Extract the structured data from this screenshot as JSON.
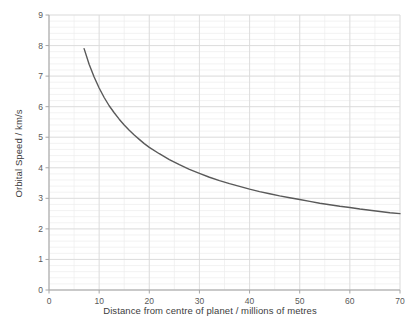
{
  "chart_data": {
    "type": "line",
    "title": "",
    "xlabel": "Distance from centre of planet / millions of metres",
    "ylabel": "Orbital Speed / km/s",
    "xlim": [
      0,
      70
    ],
    "ylim": [
      0,
      9
    ],
    "xticks": [
      0,
      10,
      20,
      30,
      40,
      50,
      60,
      70
    ],
    "yticks": [
      0,
      1,
      2,
      3,
      4,
      5,
      6,
      7,
      8,
      9
    ],
    "xtick_labels": [
      "0",
      "10",
      "20",
      "30",
      "40",
      "50",
      "60",
      "70"
    ],
    "ytick_labels": [
      "0",
      "1",
      "2",
      "3",
      "4",
      "5",
      "6",
      "7",
      "8",
      "9"
    ],
    "grid": true,
    "grid_minor_y_step": 0.2,
    "grid_minor_x_step": 5,
    "legend": false,
    "legend_position": "none",
    "series": [
      {
        "name": "orbital speed",
        "color": "#595959",
        "relation": "v = k / sqrt(r), k = 20.9",
        "x": [
          7,
          8,
          9,
          10,
          11,
          12,
          13,
          14,
          15,
          16,
          17,
          18,
          19,
          20,
          22,
          24,
          26,
          28,
          30,
          32,
          34,
          36,
          38,
          40,
          42,
          44,
          46,
          48,
          50,
          52,
          54,
          56,
          58,
          60,
          62,
          64,
          66,
          68,
          70
        ],
        "y": [
          7.9,
          7.39,
          6.97,
          6.61,
          6.3,
          6.03,
          5.8,
          5.59,
          5.4,
          5.23,
          5.07,
          4.93,
          4.79,
          4.67,
          4.46,
          4.27,
          4.1,
          3.95,
          3.82,
          3.69,
          3.58,
          3.48,
          3.39,
          3.3,
          3.22,
          3.15,
          3.08,
          3.02,
          2.96,
          2.9,
          2.84,
          2.79,
          2.74,
          2.7,
          2.65,
          2.61,
          2.57,
          2.53,
          2.5
        ]
      }
    ]
  },
  "colors": {
    "line": "#595959",
    "axis": "#a6a6a6",
    "grid_major": "#d9d9d9",
    "grid_minor": "#ececec",
    "tick_text": "#595959",
    "title_text": "#3c3c3c",
    "background": "#ffffff"
  }
}
